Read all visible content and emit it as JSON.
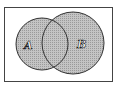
{
  "diagram": {
    "type": "venn",
    "shaded_region": "A union B",
    "sets": [
      {
        "label": "A",
        "cx": 42,
        "cy": 44,
        "r": 26
      },
      {
        "label": "B",
        "cx": 73,
        "cy": 43,
        "r": 31
      }
    ],
    "universe": {
      "x": 4,
      "y": 7,
      "width": 109,
      "height": 75
    },
    "colors": {
      "fill": "#b8b8b8",
      "stroke": "#333333",
      "background": "#ffffff"
    }
  }
}
